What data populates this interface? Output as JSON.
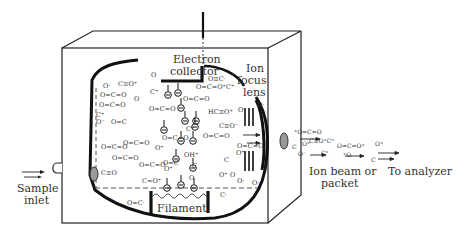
{
  "diagram": {
    "type": "ion-source-schematic",
    "labels": {
      "electron_collector": [
        "Electron",
        "collector"
      ],
      "ion_focus_lens": [
        "Ion",
        "focus",
        "lens"
      ],
      "sample_inlet": [
        "Sample",
        "inlet"
      ],
      "filament": "Filament",
      "ion_beam": [
        "Ion beam or",
        "packet"
      ],
      "to_analyzer": "To analyzer"
    },
    "molecules": [
      {
        "t": "O·",
        "x": 103,
        "y": 88
      },
      {
        "t": "C≡O⁺",
        "x": 118,
        "y": 86
      },
      {
        "t": "O",
        "x": 151,
        "y": 77
      },
      {
        "t": "O=C=O",
        "x": 100,
        "y": 97
      },
      {
        "t": "C⁺",
        "x": 150,
        "y": 94
      },
      {
        "t": "O=C=O",
        "x": 99,
        "y": 107
      },
      {
        "t": "O",
        "x": 134,
        "y": 101
      },
      {
        "t": "C⁺",
        "x": 96,
        "y": 117
      },
      {
        "t": "O⁻",
        "x": 96,
        "y": 124
      },
      {
        "t": "O=C",
        "x": 111,
        "y": 124
      },
      {
        "t": "O=C=O",
        "x": 149,
        "y": 111
      },
      {
        "t": "O=C=O",
        "x": 183,
        "y": 101
      },
      {
        "t": "O=C=O⁺",
        "x": 196,
        "y": 89
      },
      {
        "t": "C⁺",
        "x": 226,
        "y": 89
      },
      {
        "t": "HC≡O⁺",
        "x": 208,
        "y": 114
      },
      {
        "t": "O·",
        "x": 238,
        "y": 112
      },
      {
        "t": "O≡C·",
        "x": 208,
        "y": 81
      },
      {
        "t": "C⁺",
        "x": 186,
        "y": 131
      },
      {
        "t": "O=C=O",
        "x": 123,
        "y": 145
      },
      {
        "t": "O=C=O",
        "x": 162,
        "y": 140
      },
      {
        "t": "O⁺",
        "x": 155,
        "y": 150
      },
      {
        "t": "OH⁺",
        "x": 184,
        "y": 157
      },
      {
        "t": "O=C=O",
        "x": 203,
        "y": 138
      },
      {
        "t": "C≡O⁻",
        "x": 219,
        "y": 128
      },
      {
        "t": "O=C=O",
        "x": 101,
        "y": 149
      },
      {
        "t": "O=C=O",
        "x": 112,
        "y": 160
      },
      {
        "t": "C≡O",
        "x": 101,
        "y": 175
      },
      {
        "t": "O=C=O",
        "x": 139,
        "y": 167
      },
      {
        "t": "C=O⁺",
        "x": 142,
        "y": 183
      },
      {
        "t": "O⁺",
        "x": 164,
        "y": 171
      },
      {
        "t": "O=C",
        "x": 163,
        "y": 165
      },
      {
        "t": "C",
        "x": 192,
        "y": 168
      },
      {
        "t": "O",
        "x": 189,
        "y": 180
      },
      {
        "t": "C",
        "x": 224,
        "y": 162
      },
      {
        "t": "O⁺",
        "x": 219,
        "y": 177
      },
      {
        "t": "O",
        "x": 230,
        "y": 177
      },
      {
        "t": "O·",
        "x": 237,
        "y": 183
      },
      {
        "t": "C·",
        "x": 220,
        "y": 197
      },
      {
        "t": "O=C·",
        "x": 127,
        "y": 205
      },
      {
        "t": "O=C=O",
        "x": 237,
        "y": 148
      },
      {
        "t": "O⁺",
        "x": 236,
        "y": 155
      },
      {
        "t": "O·",
        "x": 252,
        "y": 185
      },
      {
        "t": "O·",
        "x": 257,
        "y": 107
      }
    ],
    "beam_molecules": [
      {
        "t": "⁺O=C=O",
        "x": 294,
        "y": 134
      },
      {
        "t": "C≡O⁺C⁺",
        "x": 309,
        "y": 143
      },
      {
        "t": "O⁺",
        "x": 302,
        "y": 146
      },
      {
        "t": "O=C=O⁺",
        "x": 337,
        "y": 148
      },
      {
        "t": "O⁺",
        "x": 375,
        "y": 146
      },
      {
        "t": "C",
        "x": 292,
        "y": 149
      },
      {
        "t": "O⁻",
        "x": 298,
        "y": 156
      },
      {
        "t": "C⁺",
        "x": 321,
        "y": 155
      },
      {
        "t": "⁺O",
        "x": 343,
        "y": 157
      },
      {
        "t": "C",
        "x": 371,
        "y": 162
      }
    ]
  }
}
